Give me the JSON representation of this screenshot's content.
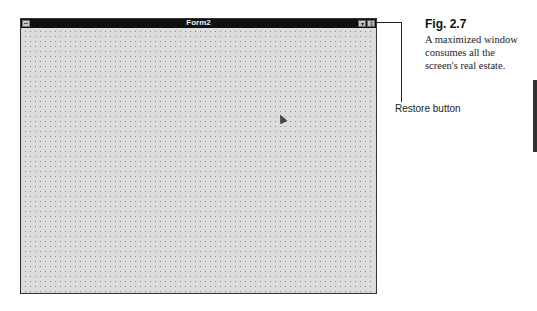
{
  "window": {
    "title": "Form2",
    "buttons": {
      "minimize": "▾",
      "restore": "⇕"
    }
  },
  "callout": {
    "label": "Restore button"
  },
  "figure": {
    "number": "Fig. 2.7",
    "caption": "A maximized window consumes all the screen's real estate."
  },
  "colors": {
    "titlebar": "#111111",
    "client": "#dcdcdc"
  }
}
